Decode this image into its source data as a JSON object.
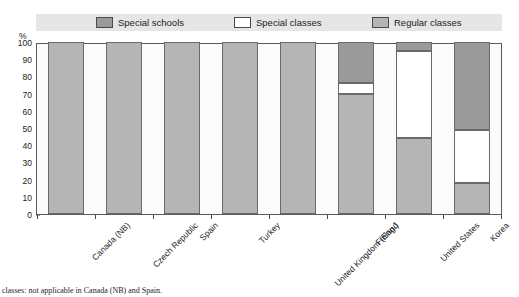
{
  "chart_data": {
    "type": "bar",
    "subtype": "stacked-percentage-column",
    "title": "",
    "xlabel": "",
    "ylabel": "%",
    "ylim": [
      0,
      100
    ],
    "ytick_labels": [
      "100",
      "90",
      "80",
      "70",
      "60",
      "50",
      "40",
      "30",
      "20",
      "10",
      "0"
    ],
    "ytick_values": [
      100,
      90,
      80,
      70,
      60,
      50,
      40,
      30,
      20,
      10,
      0
    ],
    "grid": false,
    "legend_position": "top",
    "categories": [
      "Canada (NB)",
      "Czech Republic",
      "Spain",
      "Turkey",
      "United Kingdom (Eng.)",
      "Finland",
      "United States",
      "Korea"
    ],
    "series": [
      {
        "name": "Special schools",
        "color": "#9a9a9a",
        "values": [
          0,
          0,
          0,
          0,
          0,
          24,
          5,
          51
        ]
      },
      {
        "name": "Special classes",
        "color": "#ffffff",
        "values": [
          0,
          0,
          0,
          0,
          0,
          6,
          51,
          31
        ]
      },
      {
        "name": "Regular classes",
        "color": "#b5b5b5",
        "values": [
          100,
          100,
          100,
          100,
          100,
          70,
          44,
          18
        ]
      }
    ],
    "footnote": "classes: not applicable in Canada (NB) and Spain."
  },
  "legend": {
    "items": [
      {
        "label": "Special schools",
        "swatch": "#9a9a9a"
      },
      {
        "label": "Special classes",
        "swatch": "#ffffff"
      },
      {
        "label": "Regular classes",
        "swatch": "#b5b5b5"
      }
    ]
  },
  "axis": {
    "y_unit_label": "%"
  }
}
